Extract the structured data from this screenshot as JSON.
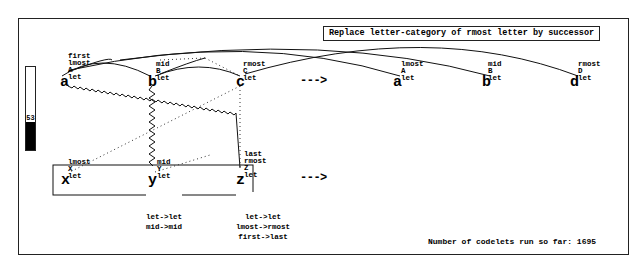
{
  "rule": {
    "text": "Replace letter-category of rmost letter by successor"
  },
  "temperature": {
    "value": "53",
    "fill_percent": 34
  },
  "arrows": {
    "row1": "--->",
    "row2": "--->"
  },
  "initial": {
    "letters": [
      {
        "char": "a",
        "desc": [
          "first",
          "lmost",
          "A",
          "let"
        ]
      },
      {
        "char": "b",
        "desc": [
          "mid",
          "B",
          "let"
        ]
      },
      {
        "char": "c",
        "desc": [
          "rmost",
          "C",
          "let"
        ]
      }
    ]
  },
  "modified": {
    "letters": [
      {
        "char": "a",
        "desc": [
          "lmost",
          "A",
          "let"
        ]
      },
      {
        "char": "b",
        "desc": [
          "mid",
          "B",
          "let"
        ]
      },
      {
        "char": "d",
        "desc": [
          "rmost",
          "D",
          "let"
        ]
      }
    ]
  },
  "target": {
    "letters": [
      {
        "char": "x",
        "desc": [
          "lmost",
          "X",
          "let"
        ]
      },
      {
        "char": "y",
        "desc": [
          "mid",
          "Y",
          "let"
        ]
      },
      {
        "char": "z",
        "desc": [
          "last",
          "rmost",
          "Z",
          "let"
        ]
      }
    ],
    "mappings": {
      "y": [
        "let->let",
        "mid->mid"
      ],
      "z": [
        "let->let",
        "lmost->rmost",
        "first->last"
      ]
    }
  },
  "status": {
    "codelets_text": "Number of codelets run so far: 1695"
  }
}
